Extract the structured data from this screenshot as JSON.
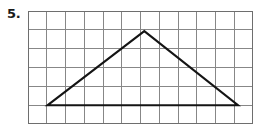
{
  "page": {
    "background_color": "#ffffff"
  },
  "problem": {
    "number_label": "5.",
    "number_color": "#1b1b1b"
  },
  "figure": {
    "name": "triangle-on-grid",
    "grid": {
      "columns": 12,
      "rows": 6,
      "cell_width": 18.75,
      "cell_height": 18.83,
      "line_color": "#878787",
      "border_color": "#6e6e6e",
      "origin_x": 28,
      "origin_y": 11,
      "width": 225,
      "height": 113
    },
    "shape": {
      "type": "triangle",
      "stroke_color": "#141414",
      "stroke_width": 2.1,
      "fill": "none",
      "vertices_grid_units": [
        {
          "name": "bottom-left-vertex",
          "col": 1.05,
          "row": 5.0
        },
        {
          "name": "apex-vertex",
          "col": 6.2,
          "row": 1.07
        },
        {
          "name": "bottom-right-vertex",
          "col": 11.2,
          "row": 5.0
        }
      ],
      "points_svg": "19.7,94.2 116.3,20.1 210,94.2"
    }
  }
}
